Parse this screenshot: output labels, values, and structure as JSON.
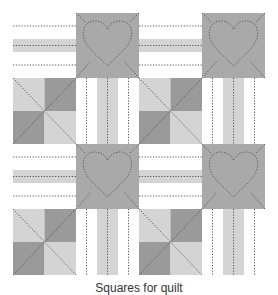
{
  "diagram": {
    "grid": {
      "rows": 4,
      "cols": 4
    },
    "layout": [
      [
        "horizontal-stripes",
        "heart",
        "horizontal-stripes",
        "heart"
      ],
      [
        "pinwheel",
        "vertical-stripes",
        "pinwheel",
        "vertical-stripes"
      ],
      [
        "horizontal-stripes",
        "heart",
        "horizontal-stripes",
        "heart"
      ],
      [
        "pinwheel",
        "vertical-stripes",
        "pinwheel",
        "vertical-stripes"
      ]
    ],
    "colors": {
      "white": "#ffffff",
      "light": "#d4d4d4",
      "medium": "#a9a9a9",
      "dark": "#9a9a9a",
      "stitch": "#555555"
    }
  },
  "caption": "Squares for quilt"
}
